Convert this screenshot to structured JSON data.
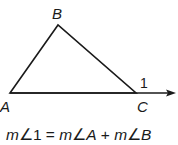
{
  "diagram": {
    "vertices": [
      {
        "name": "A",
        "x": 10,
        "y": 93,
        "label_x": 0,
        "label_y": 110
      },
      {
        "name": "B",
        "x": 58,
        "y": 25,
        "label_x": 52,
        "label_y": 19
      },
      {
        "name": "C",
        "x": 136,
        "y": 93,
        "label_x": 137,
        "label_y": 111
      }
    ],
    "exterior_angle_label": "1",
    "ray_end": {
      "x": 175,
      "y": 93
    },
    "colors": {
      "stroke": "#1a1a1a",
      "background": "#ffffff"
    }
  },
  "labels": {
    "A": "A",
    "B": "B",
    "C": "C",
    "angle": "1"
  },
  "equation": {
    "text": "m∠1 = m∠A + m∠B",
    "parts": [
      "m",
      "∠1 = ",
      "m",
      "∠",
      "A",
      " + ",
      "m",
      "∠",
      "B"
    ]
  }
}
